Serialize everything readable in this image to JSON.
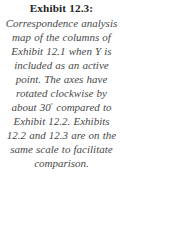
{
  "figure": {
    "label": "Exhibit 12.3:",
    "caption_text": "Correspondence analysis map of the columns of Exhibit 12.1 when Y is included as an active point. The axes have rotated clockwise by about 30° compared to Exhibit 12.2. Exhibits 12.2 and 12.3 are on the same scale to facilitate comparison.",
    "caption_part_1": "Correspondence analysis map of the columns of Exhibit 12.1 when Y is included as an active point. The axes have rotated clockwise by about 30",
    "degree_symbol": "◦",
    "caption_part_2": "compared to Exhibit 12.2. Exhibits 12.2 and 12.3 are on the same scale to facilitate comparison.",
    "lines": [
      "Correspondence",
      "analysis map of the",
      "columns of Exhibit",
      "12.1 when Y is",
      "included as an active",
      "point. The axes have",
      "rotated clockwise by",
      "about 30° compared",
      "to Exhibit 12.2.",
      "Exhibits 12.2 and",
      "12.3 are on the same",
      "scale to facilitate",
      "comparison."
    ],
    "referenced_exhibits": [
      "12.1",
      "12.2",
      "12.3"
    ],
    "rotation_degrees": 30,
    "rotation_direction": "clockwise",
    "colors": {
      "background": "#ffffff",
      "title_text": "#262626",
      "body_text": "#494949"
    }
  }
}
